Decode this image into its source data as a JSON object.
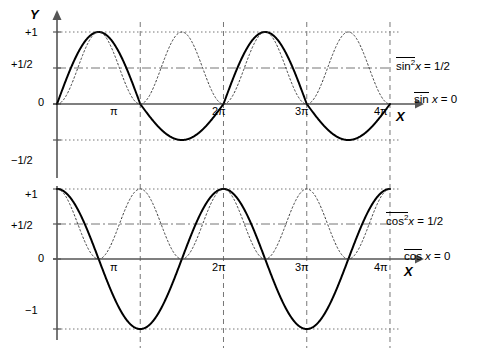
{
  "figure": {
    "background": "#ffffff",
    "page_background": "#f2f2f2",
    "curve_color": "#000000",
    "axis_color": "#555555",
    "grid_color": "#777777"
  },
  "axes": {
    "x_label": "X",
    "y_label": "Y",
    "x_ticks": [
      "π",
      "2π",
      "3π",
      "4π"
    ],
    "x_tick_values": [
      3.14159,
      6.28318,
      9.42478,
      12.56637
    ],
    "xlim": [
      0,
      13.2
    ],
    "top": {
      "y_ticks": [
        "+1",
        "+1/2",
        "0",
        "−1/2"
      ],
      "y_tick_values": [
        1,
        0.5,
        0,
        -0.5
      ],
      "ylim": [
        -0.72,
        1.12
      ]
    },
    "bottom": {
      "y_ticks": [
        "+1",
        "+1/2",
        "0",
        "−1"
      ],
      "y_tick_values": [
        1,
        0.5,
        0,
        -1
      ],
      "ylim": [
        -1.22,
        1.12
      ]
    }
  },
  "annotations": {
    "top_mean_square": {
      "overline": "sin",
      "sup": "2",
      "var": "x",
      "equals": " = 1/2",
      "full": "sin²x = 1/2"
    },
    "top_mean": {
      "overline": "sin",
      "var": "x",
      "equals": " = 0",
      "full": "sin x = 0"
    },
    "bottom_mean_square": {
      "overline": "cos",
      "sup": "2",
      "var": "x",
      "equals": " = 1/2",
      "full": "cos²x = 1/2"
    },
    "bottom_mean": {
      "overline": "cos",
      "var": "x",
      "equals": " = 0",
      "full": "cos x = 0"
    }
  },
  "chart_data": {
    "type": "line",
    "title": "",
    "xlabel": "X",
    "ylabel": "Y",
    "grid": true,
    "legend": "none",
    "panels": [
      {
        "name": "top-panel",
        "xlim": [
          0,
          13.2
        ],
        "ylim": [
          -0.72,
          1.12
        ],
        "x_ticks": [
          3.14159,
          6.28318,
          9.42478,
          12.56637
        ],
        "x_tick_labels": [
          "π",
          "2π",
          "3π",
          "4π"
        ],
        "y_ticks": [
          1,
          0.5,
          0,
          -0.5
        ],
        "y_tick_labels": [
          "+1",
          "+1/2",
          "0",
          "−1/2"
        ],
        "series": [
          {
            "name": "sin-envelope-solid",
            "style": "solid",
            "width": 2,
            "formula": "abs-arches-with-half-dip",
            "description": "solid curve: arches to +1 over (0,pi) and (2pi,3pi); dips to -1/2 over (pi,2pi) and (3pi,4pi)",
            "key_points": [
              {
                "x": 0,
                "y": 0
              },
              {
                "x": 1.5708,
                "y": 1
              },
              {
                "x": 3.14159,
                "y": 0
              },
              {
                "x": 4.712,
                "y": -0.5
              },
              {
                "x": 6.28318,
                "y": 0
              },
              {
                "x": 7.854,
                "y": 1
              },
              {
                "x": 9.42478,
                "y": 0
              },
              {
                "x": 10.996,
                "y": -0.5
              },
              {
                "x": 12.56637,
                "y": 0
              }
            ]
          },
          {
            "name": "sin-squared-dotted",
            "style": "dotted",
            "width": 1,
            "formula": "sin^2(x)",
            "description": "dotted curve: sin squared, period pi, range 0..1",
            "key_points": [
              {
                "x": 0,
                "y": 0
              },
              {
                "x": 1.5708,
                "y": 1
              },
              {
                "x": 3.14159,
                "y": 0
              },
              {
                "x": 4.712,
                "y": 1
              },
              {
                "x": 6.28318,
                "y": 0
              },
              {
                "x": 7.854,
                "y": 1
              },
              {
                "x": 9.42478,
                "y": 0
              },
              {
                "x": 10.996,
                "y": 1
              },
              {
                "x": 12.56637,
                "y": 0
              }
            ]
          }
        ],
        "reference_lines": [
          {
            "name": "mean-square-line",
            "y": 0.5,
            "style": "dash-dot"
          },
          {
            "name": "mean-line",
            "y": 0,
            "style": "solid"
          },
          {
            "name": "upper-bound",
            "y": 1,
            "style": "dotted"
          },
          {
            "name": "lower-bound",
            "y": -0.5,
            "style": "dotted"
          }
        ]
      },
      {
        "name": "bottom-panel",
        "xlim": [
          0,
          13.2
        ],
        "ylim": [
          -1.22,
          1.12
        ],
        "x_ticks": [
          3.14159,
          6.28318,
          9.42478,
          12.56637
        ],
        "x_tick_labels": [
          "π",
          "2π",
          "3π",
          "4π"
        ],
        "y_ticks": [
          1,
          0.5,
          0,
          -1
        ],
        "y_tick_labels": [
          "+1",
          "+1/2",
          "0",
          "−1"
        ],
        "series": [
          {
            "name": "cos-solid",
            "style": "solid",
            "width": 2,
            "formula": "cos(x)",
            "description": "solid curve: cosine, period 2pi, range -1..1",
            "key_points": [
              {
                "x": 0,
                "y": 1
              },
              {
                "x": 1.5708,
                "y": 0
              },
              {
                "x": 3.14159,
                "y": -1
              },
              {
                "x": 4.712,
                "y": 0
              },
              {
                "x": 6.28318,
                "y": 1
              },
              {
                "x": 7.854,
                "y": 0
              },
              {
                "x": 9.42478,
                "y": -1
              },
              {
                "x": 10.996,
                "y": 0
              },
              {
                "x": 12.56637,
                "y": 1
              }
            ]
          },
          {
            "name": "cos-squared-dotted",
            "style": "dotted",
            "width": 1,
            "formula": "cos^2(x)",
            "description": "dotted curve: cosine squared, period pi, range 0..1",
            "key_points": [
              {
                "x": 0,
                "y": 1
              },
              {
                "x": 1.5708,
                "y": 0
              },
              {
                "x": 3.14159,
                "y": 1
              },
              {
                "x": 4.712,
                "y": 0
              },
              {
                "x": 6.28318,
                "y": 1
              },
              {
                "x": 7.854,
                "y": 0
              },
              {
                "x": 9.42478,
                "y": 1
              },
              {
                "x": 10.996,
                "y": 0
              },
              {
                "x": 12.56637,
                "y": 1
              }
            ]
          }
        ],
        "reference_lines": [
          {
            "name": "mean-square-line",
            "y": 0.5,
            "style": "dash-dot"
          },
          {
            "name": "mean-line",
            "y": 0,
            "style": "solid"
          },
          {
            "name": "upper-bound",
            "y": 1,
            "style": "dotted"
          },
          {
            "name": "lower-bound",
            "y": -1,
            "style": "dotted"
          }
        ]
      }
    ]
  }
}
